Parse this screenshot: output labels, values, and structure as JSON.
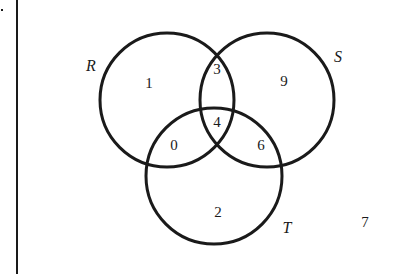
{
  "diagram": {
    "type": "venn-3-sets",
    "sets": [
      {
        "name": "R",
        "cx": 167,
        "cy": 100,
        "r": 67
      },
      {
        "name": "S",
        "cx": 267,
        "cy": 100,
        "r": 67
      },
      {
        "name": "T",
        "cx": 214,
        "cy": 176,
        "r": 68
      }
    ],
    "set_labels": {
      "R": "R",
      "S": "S",
      "T": "T"
    },
    "regions": {
      "R_only": "1",
      "S_only": "9",
      "T_only": "2",
      "R_and_S_only": "3",
      "R_and_T_only": "0",
      "S_and_T_only": "6",
      "R_and_S_and_T": "4",
      "outside": "7"
    },
    "stroke_color": "#1a1a1a",
    "background_color": "#ffffff"
  }
}
